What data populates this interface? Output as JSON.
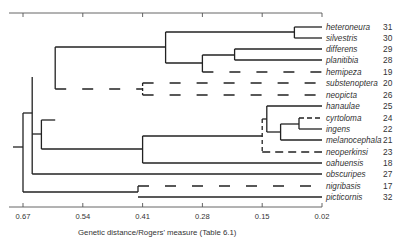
{
  "chart_data": {
    "type": "dendrogram",
    "title": "",
    "xlabel": "Genetic distance / Rogers' measure (Table 6.1)",
    "xticks": [
      "0.67",
      "0.54",
      "0.41",
      "0.28",
      "0.15",
      "0.02"
    ],
    "xlim": [
      0.7,
      0.02
    ],
    "leaves": [
      {
        "name": "heteroneura",
        "id": "31"
      },
      {
        "name": "silvestris",
        "id": "30"
      },
      {
        "name": "differens",
        "id": "29"
      },
      {
        "name": "planitibia",
        "id": "28"
      },
      {
        "name": "hemipeza",
        "id": "19"
      },
      {
        "name": "substenoptera",
        "id": "20"
      },
      {
        "name": "neopicta",
        "id": "26"
      },
      {
        "name": "hanaulae",
        "id": "25"
      },
      {
        "name": "cyrtoloma",
        "id": "24"
      },
      {
        "name": "ingens",
        "id": "22"
      },
      {
        "name": "melanocephala",
        "id": "21"
      },
      {
        "name": "neoperkinsi",
        "id": "23"
      },
      {
        "name": "oahuensis",
        "id": "18"
      },
      {
        "name": "obscuripes",
        "id": "27"
      },
      {
        "name": "nigribasis",
        "id": "17"
      },
      {
        "name": "picticornis",
        "id": "32"
      }
    ],
    "dashed_branches": [
      "hemipeza",
      "substenoptera",
      "neopicta",
      "cyrtoloma",
      "neoperkinsi",
      "nigribasis"
    ],
    "join_distances": {
      "heteroneura+silvestris": 0.08,
      "differens+planitibia": 0.21,
      "(differens,planitibia)+hemipeza": 0.28,
      "(het,sil)+(dif,pla,hem)": 0.36,
      "substenoptera+neopicta": 0.41,
      "cyrtoloma+ingens": 0.07,
      "(cyr,ing)+melanocephala": 0.11,
      "hanaulae+(cyr,ing,mel)": 0.14,
      "(han..mel)+neoperkinsi": 0.15,
      "(han..neo)+oahuensis": 0.41,
      "nigribasis+picticornis": 0.42,
      "planitibia-group+substenoptera-group": 0.6,
      "planitibia-group+oahuensis-group": 0.63,
      "+obscuripes": 0.65,
      "root+(nigribasis,picticornis)": 0.67
    }
  }
}
